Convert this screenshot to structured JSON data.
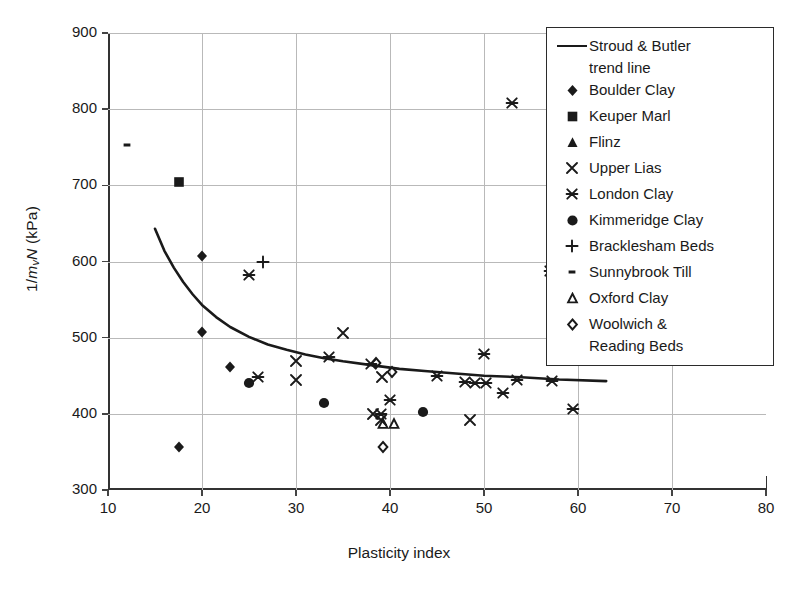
{
  "chart_data": {
    "type": "scatter",
    "title": "",
    "xlabel": "Plasticity index",
    "ylabel": "1/mvN (kPa)",
    "ylabel_parts": {
      "pre": "1/",
      "m": "m",
      "sub": "v",
      "n": "N",
      "unit": " (kPa)"
    },
    "xlim": [
      10,
      80
    ],
    "ylim": [
      300,
      900
    ],
    "xticks": [
      10,
      20,
      30,
      40,
      50,
      60,
      70,
      80
    ],
    "yticks": [
      300,
      400,
      500,
      600,
      700,
      800,
      900
    ],
    "grid": true,
    "legend_position": "top-right",
    "colors": {
      "ink": "#1a1a1a",
      "grid": "#b9b9b9",
      "axis": "#333333"
    },
    "series": [
      {
        "name": "Stroud & Butler trend line",
        "marker": "line",
        "points": [
          [
            15.0,
            643
          ],
          [
            16.0,
            614
          ],
          [
            17.0,
            592
          ],
          [
            18.0,
            573
          ],
          [
            19.0,
            557
          ],
          [
            20.0,
            543
          ],
          [
            21.5,
            527
          ],
          [
            23.0,
            514
          ],
          [
            25.0,
            501
          ],
          [
            27.0,
            491
          ],
          [
            29.0,
            484
          ],
          [
            31.0,
            478
          ],
          [
            33.0,
            473
          ],
          [
            35.0,
            469
          ],
          [
            38.0,
            464
          ],
          [
            41.0,
            459
          ],
          [
            44.0,
            456
          ],
          [
            47.0,
            453
          ],
          [
            50.0,
            450
          ],
          [
            54.0,
            448
          ],
          [
            58.0,
            445
          ],
          [
            63.0,
            443
          ]
        ]
      },
      {
        "name": "Boulder Clay",
        "marker": "diamond",
        "points": [
          [
            20.0,
            607
          ],
          [
            20.0,
            508
          ],
          [
            23.0,
            461
          ],
          [
            17.5,
            357
          ]
        ]
      },
      {
        "name": "Keuper Marl",
        "marker": "square",
        "points": [
          [
            17.5,
            704
          ]
        ]
      },
      {
        "name": "Flinz",
        "marker": "triangle-filled",
        "points": []
      },
      {
        "name": "Upper Lias",
        "marker": "x",
        "points": [
          [
            30.0,
            469
          ],
          [
            30.0,
            444
          ],
          [
            35.0,
            506
          ],
          [
            39.0,
            392
          ],
          [
            39.2,
            449
          ],
          [
            38.2,
            400
          ],
          [
            48.5,
            392
          ]
        ]
      },
      {
        "name": "London Clay",
        "marker": "star-x",
        "points": [
          [
            25.0,
            582
          ],
          [
            26.0,
            449
          ],
          [
            33.5,
            475
          ],
          [
            38.0,
            466
          ],
          [
            40.0,
            418
          ],
          [
            39.0,
            400
          ],
          [
            45.0,
            450
          ],
          [
            48.0,
            442
          ],
          [
            49.0,
            441
          ],
          [
            50.0,
            478
          ],
          [
            50.2,
            440
          ],
          [
            52.0,
            427
          ],
          [
            53.0,
            808
          ],
          [
            53.5,
            444
          ],
          [
            57.0,
            587
          ],
          [
            57.2,
            443
          ],
          [
            59.5,
            406
          ]
        ]
      },
      {
        "name": "Kimmeridge Clay",
        "marker": "circle",
        "points": [
          [
            25.0,
            441
          ],
          [
            33.0,
            414
          ],
          [
            43.5,
            402
          ]
        ]
      },
      {
        "name": "Bracklesham Beds",
        "marker": "plus",
        "points": [
          [
            26.5,
            599
          ]
        ]
      },
      {
        "name": "Sunnybrook Till",
        "marker": "dash",
        "points": [
          [
            12.0,
            753
          ]
        ]
      },
      {
        "name": "Oxford Clay",
        "marker": "triangle-open",
        "points": [
          [
            39.3,
            386
          ],
          [
            40.4,
            386
          ]
        ]
      },
      {
        "name": "Woolwich & Reading Beds",
        "marker": "diamond-open",
        "points": [
          [
            38.5,
            467
          ],
          [
            40.2,
            455
          ],
          [
            39.3,
            357
          ]
        ]
      }
    ]
  },
  "legend": {
    "entries": [
      {
        "label": "Stroud & Butler",
        "label2": "trend line",
        "marker": "line"
      },
      {
        "label": "Boulder Clay",
        "marker": "diamond"
      },
      {
        "label": "Keuper Marl",
        "marker": "square"
      },
      {
        "label": "Flinz",
        "marker": "triangle-filled"
      },
      {
        "label": "Upper Lias",
        "marker": "x"
      },
      {
        "label": "London Clay",
        "marker": "star-x"
      },
      {
        "label": "Kimmeridge Clay",
        "marker": "circle"
      },
      {
        "label": "Bracklesham Beds",
        "marker": "plus"
      },
      {
        "label": "Sunnybrook Till",
        "marker": "dash"
      },
      {
        "label": "Oxford Clay",
        "marker": "triangle-open"
      },
      {
        "label": "Woolwich &",
        "label2": "Reading Beds",
        "marker": "diamond-open"
      }
    ]
  },
  "caption": {
    "text": ""
  }
}
